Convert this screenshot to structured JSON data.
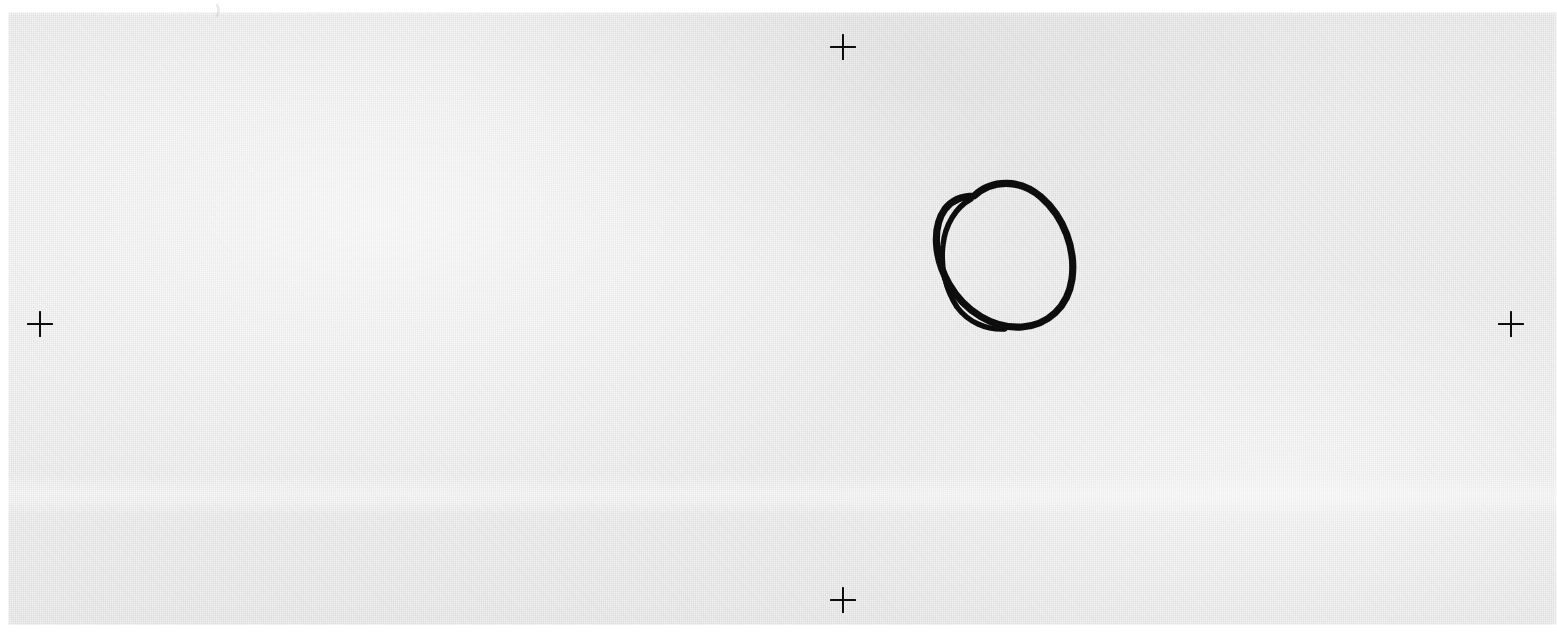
{
  "document": {
    "kind": "scanned-sheet",
    "description": "Scanned light-gray sheet of paper with four registration crosses and a single hand-drawn ink ellipse",
    "paper_color": "#e9e9e9",
    "backdrop_color": "#ffffff",
    "ink_color": "#0d0d0d",
    "width": 1557,
    "height": 643
  },
  "paper": {
    "left": 8,
    "top": 12,
    "width": 1549,
    "height": 613
  },
  "fiducials": [
    {
      "name": "top",
      "label": "+",
      "cx": 843,
      "cy": 47,
      "size": 26
    },
    {
      "name": "left",
      "label": "+",
      "cx": 40,
      "cy": 324,
      "size": 26
    },
    {
      "name": "right",
      "label": "+",
      "cx": 1511,
      "cy": 324,
      "size": 26
    },
    {
      "name": "bottom",
      "label": "+",
      "cx": 843,
      "cy": 600,
      "size": 26
    }
  ],
  "annotations": [
    {
      "name": "hand-drawn-ellipse",
      "shape": "ellipse",
      "stroke_passes": 2,
      "center_x": 998,
      "center_y": 250,
      "radius_x": 72,
      "radius_y": 86,
      "rotation_deg": 22,
      "stroke_width": 7,
      "color": "#0d0d0d"
    },
    {
      "name": "pencil-tick",
      "shape": "tick",
      "x": 215,
      "y": 10,
      "color": "#c9c9c9"
    }
  ],
  "caption": {
    "text": ""
  }
}
